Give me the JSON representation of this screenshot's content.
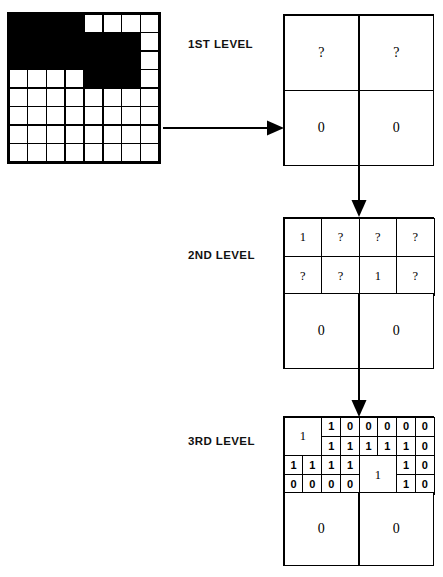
{
  "figure": {
    "type": "quadtree-decomposition-diagram",
    "title": "",
    "source_image": {
      "name": "binary-raster-grid",
      "rows": 8,
      "cols": 8,
      "black_value": 1,
      "white_value": 0,
      "matrix": [
        [
          1,
          1,
          1,
          1,
          0,
          0,
          0,
          0
        ],
        [
          1,
          1,
          1,
          1,
          1,
          1,
          1,
          0
        ],
        [
          1,
          1,
          1,
          1,
          1,
          1,
          1,
          0
        ],
        [
          0,
          0,
          0,
          0,
          1,
          1,
          1,
          0
        ],
        [
          0,
          0,
          0,
          0,
          0,
          0,
          0,
          0
        ],
        [
          0,
          0,
          0,
          0,
          0,
          0,
          0,
          0
        ],
        [
          0,
          0,
          0,
          0,
          0,
          0,
          0,
          0
        ],
        [
          0,
          0,
          0,
          0,
          0,
          0,
          0,
          0
        ]
      ]
    }
  },
  "labels": {
    "level1": "1ST LEVEL",
    "level2": "2ND LEVEL",
    "level3": "3RD LEVEL"
  },
  "arrows": {
    "source_to_level1": "right-arrow",
    "level1_to_level2": "down-arrow",
    "level2_to_level3": "down-arrow"
  },
  "level1": {
    "name": "1st level quadtree",
    "grid": "2x2",
    "cells": [
      {
        "pos": "NW",
        "value": "?"
      },
      {
        "pos": "NE",
        "value": "?"
      },
      {
        "pos": "SW",
        "value": "0"
      },
      {
        "pos": "SE",
        "value": "0"
      }
    ]
  },
  "level2": {
    "name": "2nd level quadtree",
    "cells": {
      "nw_quad": [
        {
          "pos": "NW",
          "value": "1"
        },
        {
          "pos": "NE",
          "value": "?"
        },
        {
          "pos": "SW",
          "value": "?"
        },
        {
          "pos": "SE",
          "value": "?"
        }
      ],
      "ne_quad": [
        {
          "pos": "NW",
          "value": "?"
        },
        {
          "pos": "NE",
          "value": "?"
        },
        {
          "pos": "SW",
          "value": "1"
        },
        {
          "pos": "SE",
          "value": "?"
        }
      ],
      "sw_quad": {
        "value": "0"
      },
      "se_quad": {
        "value": "0"
      }
    }
  },
  "level3": {
    "name": "3rd level quadtree",
    "nw_quad": {
      "nw": {
        "value": "1",
        "merged": true
      },
      "ne": [
        {
          "pos": "NW",
          "value": "1"
        },
        {
          "pos": "NE",
          "value": "0"
        },
        {
          "pos": "SW",
          "value": "1"
        },
        {
          "pos": "SE",
          "value": "1"
        }
      ],
      "sw": [
        {
          "pos": "NW",
          "value": "1"
        },
        {
          "pos": "NE",
          "value": "1"
        },
        {
          "pos": "SW",
          "value": "0"
        },
        {
          "pos": "SE",
          "value": "0"
        }
      ],
      "se": [
        {
          "pos": "NW",
          "value": "1"
        },
        {
          "pos": "NE",
          "value": "1"
        },
        {
          "pos": "SW",
          "value": "0"
        },
        {
          "pos": "SE",
          "value": "0"
        }
      ]
    },
    "ne_quad": {
      "nw": [
        {
          "pos": "NW",
          "value": "0"
        },
        {
          "pos": "NE",
          "value": "0"
        },
        {
          "pos": "SW",
          "value": "1"
        },
        {
          "pos": "SE",
          "value": "1"
        }
      ],
      "ne": [
        {
          "pos": "NW",
          "value": "0"
        },
        {
          "pos": "NE",
          "value": "0"
        },
        {
          "pos": "SW",
          "value": "1"
        },
        {
          "pos": "SE",
          "value": "0"
        }
      ],
      "sw": {
        "value": "1",
        "merged": true
      },
      "se": [
        {
          "pos": "NW",
          "value": "1"
        },
        {
          "pos": "NE",
          "value": "0"
        },
        {
          "pos": "SW",
          "value": "1"
        },
        {
          "pos": "SE",
          "value": "0"
        }
      ]
    },
    "sw_quad": {
      "value": "0"
    },
    "se_quad": {
      "value": "0"
    }
  },
  "colors": {
    "ink": "#000000",
    "paper": "#ffffff"
  }
}
